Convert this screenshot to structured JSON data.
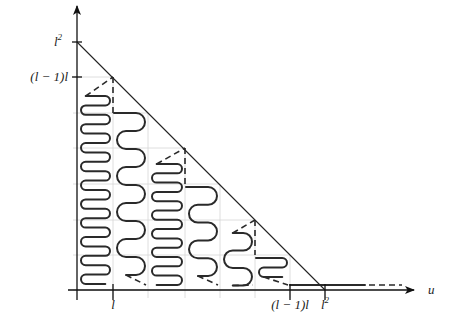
{
  "figure": {
    "y_axis": {
      "ticks": [
        {
          "label": "l",
          "sup": "2",
          "y": 42
        },
        {
          "label": "(l − 1)l",
          "sup": "",
          "y": 77
        }
      ]
    },
    "x_axis": {
      "label": "u",
      "ticks": [
        {
          "label": "l",
          "sup": "",
          "x": 113
        },
        {
          "label": "(l − 1)l",
          "sup": "",
          "x": 290
        },
        {
          "label": "l",
          "sup": "2",
          "x": 325
        }
      ]
    },
    "geometry": {
      "origin": {
        "x": 77,
        "y": 290
      },
      "columns_x": [
        77,
        113,
        148,
        185,
        220,
        255,
        290,
        325
      ],
      "column_tops_y": [
        77,
        113,
        148,
        184,
        220,
        255,
        290
      ],
      "serpentines": [
        {
          "col": 0,
          "top": 96,
          "bottom": 285,
          "step": 9.4,
          "style": "tight",
          "dashed_top": true
        },
        {
          "col": 1,
          "top": 113,
          "bottom": 276,
          "step": 18,
          "style": "wide",
          "dashed_top": false
        },
        {
          "col": 2,
          "top": 164,
          "bottom": 286,
          "step": 9.3,
          "style": "tight",
          "dashed_top": true
        },
        {
          "col": 3,
          "top": 187,
          "bottom": 276,
          "step": 17.8,
          "style": "wide",
          "dashed_top": false
        },
        {
          "col": 4,
          "top": 233,
          "bottom": 286,
          "step": 17.5,
          "style": "wide",
          "dashed_top": true
        },
        {
          "col": 5,
          "top": 258,
          "bottom": 277,
          "step": 9.5,
          "style": "tight",
          "dashed_top": false
        }
      ],
      "tail": {
        "solid_to_x": 365,
        "dashed_to_x": 402,
        "y": 285
      }
    }
  }
}
